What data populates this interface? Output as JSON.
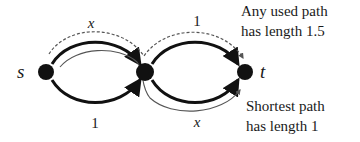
{
  "diagram": {
    "nodes": [
      {
        "id": "s",
        "label": "s",
        "x": 44,
        "y": 72
      },
      {
        "id": "m",
        "label": "",
        "x": 145,
        "y": 72
      },
      {
        "id": "t",
        "label": "t",
        "x": 243,
        "y": 72
      }
    ],
    "edges": [
      {
        "from": "s",
        "to": "m",
        "position": "top",
        "label": "x"
      },
      {
        "from": "s",
        "to": "m",
        "position": "bottom",
        "label": "1"
      },
      {
        "from": "m",
        "to": "t",
        "position": "top",
        "label": "1"
      },
      {
        "from": "m",
        "to": "t",
        "position": "bottom",
        "label": "x"
      }
    ],
    "paths": [
      {
        "name": "used-path",
        "style": "dashed",
        "route": [
          "s-m top",
          "m-t top"
        ]
      },
      {
        "name": "shortest-path",
        "style": "thin-solid",
        "route": [
          "s-m top",
          "m-t bottom"
        ]
      }
    ],
    "annotations": {
      "used_line1": "Any used path",
      "used_line2": "has length 1.5",
      "shortest_line1": "Shortest path",
      "shortest_line2": "has length 1"
    },
    "colors": {
      "edge": "#111111",
      "node": "#111111",
      "path": "#555555"
    }
  }
}
